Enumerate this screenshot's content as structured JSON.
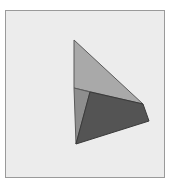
{
  "figure": {
    "frame": {
      "x": 5,
      "y": 10,
      "width": 158,
      "height": 166,
      "background": "#ececec",
      "border": "#9a9a9a"
    },
    "shapes": [
      {
        "name": "upper-light-triangle",
        "points": "74,40 74,88 143,104",
        "fill": "#a9a9a9",
        "stroke": "#5a5a5a"
      },
      {
        "name": "left-sliver-triangle",
        "points": "74,88 90,92 76,144",
        "fill": "#8e8e8e",
        "stroke": "#5a5a5a"
      },
      {
        "name": "dark-quadrilateral",
        "points": "90,92 143,104 149,121 76,144",
        "fill": "#545454",
        "stroke": "#3a3a3a"
      }
    ]
  }
}
